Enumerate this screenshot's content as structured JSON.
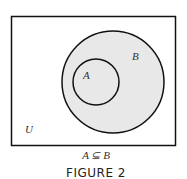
{
  "diagram": {
    "type": "venn",
    "universe_label": "U",
    "sets": [
      {
        "name": "A",
        "label": "A",
        "subset_of": "B"
      },
      {
        "name": "B",
        "label": "B"
      }
    ],
    "relation": "A ⊆ B",
    "figure_caption": "FIGURE 2",
    "colors": {
      "fill": "#e8e8e8",
      "stroke": "#111111",
      "background": "#ffffff"
    }
  }
}
